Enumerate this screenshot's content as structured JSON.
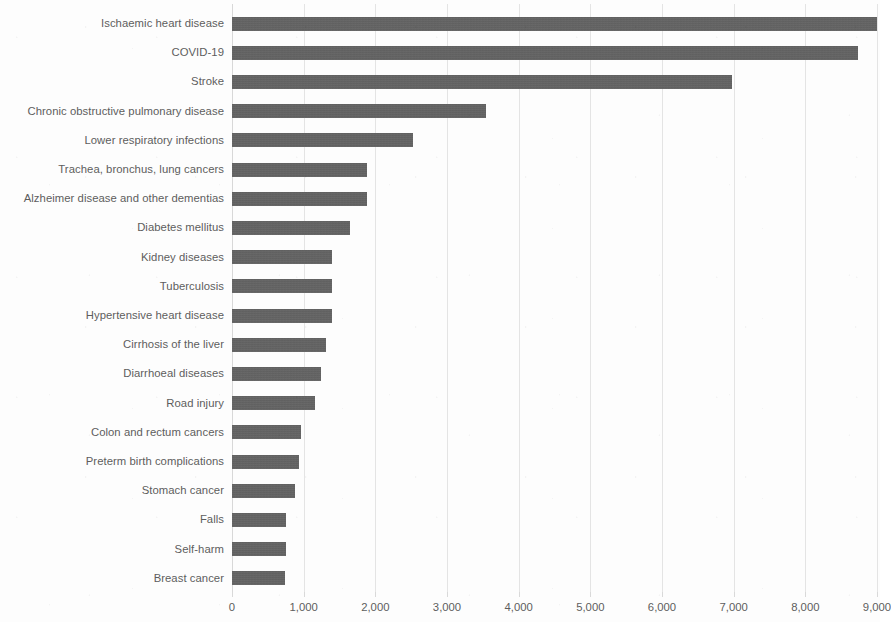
{
  "chart_data": {
    "type": "bar",
    "orientation": "horizontal",
    "title": "",
    "subtitle": "",
    "xlabel": "",
    "ylabel": "",
    "xlim": [
      0,
      9000
    ],
    "grid": true,
    "legend": null,
    "xticks": [
      0,
      1000,
      2000,
      3000,
      4000,
      5000,
      6000,
      7000,
      8000,
      9000
    ],
    "xtick_labels": [
      "0",
      "1,000",
      "2,000",
      "3,000",
      "4,000",
      "5,000",
      "6,000",
      "7,000",
      "8,000",
      "9,000"
    ],
    "bar_color": "#5b5b5b",
    "categories": [
      "Ischaemic heart disease",
      "COVID-19",
      "Stroke",
      "Chronic obstructive pulmonary disease",
      "Lower respiratory infections",
      "Trachea, bronchus, lung cancers",
      "Alzheimer disease and other dementias",
      "Diabetes mellitus",
      "Kidney diseases",
      "Tuberculosis",
      "Hypertensive heart disease",
      "Cirrhosis of the liver",
      "Diarrhoeal diseases",
      "Road injury",
      "Colon and rectum cancers",
      "Preterm birth complications",
      "Stomach cancer",
      "Falls",
      "Self-harm",
      "Breast cancer"
    ],
    "values": [
      9000,
      8730,
      6970,
      3540,
      2530,
      1890,
      1880,
      1640,
      1390,
      1400,
      1400,
      1310,
      1240,
      1160,
      960,
      930,
      875,
      760,
      760,
      740
    ]
  }
}
